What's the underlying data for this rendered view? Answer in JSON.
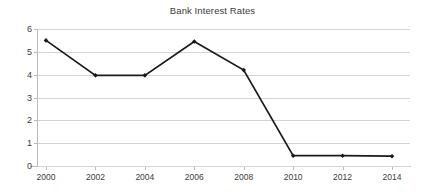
{
  "chart_data": {
    "type": "line",
    "title": "Bank Interest Rates",
    "xlabel": "",
    "ylabel": "",
    "categories": [
      "2000",
      "2002",
      "2004",
      "2006",
      "2008",
      "2010",
      "2012",
      "2014"
    ],
    "x": [
      2000,
      2002,
      2004,
      2006,
      2008,
      2010,
      2012,
      2014
    ],
    "values": [
      5.5,
      3.97,
      3.97,
      5.45,
      4.2,
      0.45,
      0.45,
      0.43
    ],
    "series": [
      {
        "name": "Bank Interest Rates",
        "values": [
          5.5,
          3.97,
          3.97,
          5.45,
          4.2,
          0.45,
          0.45,
          0.43
        ]
      }
    ],
    "xlim": [
      2000,
      2014
    ],
    "ylim": [
      0,
      6
    ],
    "y_ticks": [
      0,
      1,
      2,
      3,
      4,
      5,
      6
    ],
    "y_tick_labels": [
      "0",
      "1",
      "2",
      "3",
      "4",
      "5",
      "6"
    ],
    "x_ticks": [
      2000,
      2002,
      2004,
      2006,
      2008,
      2010,
      2012,
      2014
    ],
    "x_tick_labels": [
      "2000",
      "2002",
      "2004",
      "2006",
      "2008",
      "2010",
      "2012",
      "2014"
    ],
    "grid": true,
    "grid_axis": "y",
    "legend": false,
    "legend_position": "none",
    "marker": "diamond",
    "line_color": "#1a1a1a",
    "marker_color": "#1a1a1a",
    "grid_color": "#d4d4d4",
    "axis_color": "#bcbcbc",
    "text_color": "#3b3b3b",
    "background_color": "#ffffff"
  }
}
